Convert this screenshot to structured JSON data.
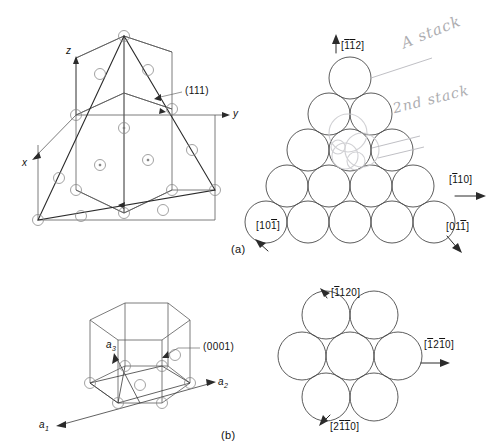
{
  "figure": {
    "background_color": "#ffffff",
    "line_color": "#3a3a3a",
    "atom_outline_color": "#7a7a7a",
    "annotation_color": "#8e8e93"
  },
  "panel_a": {
    "caption": "(a)",
    "cube": {
      "axis_labels": {
        "x": "x",
        "y": "y",
        "z": "z"
      },
      "plane_label": "(111)",
      "description": "FCC unit cell with (111) close-packed plane highlighted as a triangle"
    },
    "packing": {
      "description": "Triangular close-packed array of atoms on the (111) plane",
      "rows": [
        1,
        2,
        3,
        4,
        5
      ],
      "direction_up": "[112]",
      "direction_up_bars": [
        1,
        1,
        0
      ],
      "direction_right": "[110]",
      "direction_right_bars": [
        1,
        0,
        0
      ],
      "direction_lower_right": "[011]",
      "direction_lower_right_bars": [
        0,
        0,
        1
      ],
      "direction_lower_left": "[101]",
      "direction_lower_left_bars": [
        0,
        0,
        1
      ]
    },
    "handwriting": [
      {
        "text": "A stack",
        "note": "handwritten annotation pointing to top atom"
      },
      {
        "text": "2nd stack",
        "note": "handwritten annotation pointing to second layer atoms"
      }
    ]
  },
  "panel_b": {
    "caption": "(b)",
    "cell": {
      "axis_labels": {
        "a1": "a",
        "a1_sub": "1",
        "a2": "a",
        "a2_sub": "2",
        "a3": "a",
        "a3_sub": "3"
      },
      "plane_label": "(0001)",
      "description": "HCP unit cell with (0001) basal plane indicated"
    },
    "packing": {
      "description": "Hexagonal close-packed array of seven atoms on the (0001) basal plane",
      "atom_count": 7,
      "direction_up": "[1120]",
      "direction_up_bars": [
        0,
        1,
        0,
        0
      ],
      "direction_right": "[1210]",
      "direction_right_bars": [
        1,
        0,
        1,
        0
      ],
      "direction_down": "[2110]",
      "direction_down_bars": [
        0,
        1,
        1,
        0
      ]
    }
  }
}
